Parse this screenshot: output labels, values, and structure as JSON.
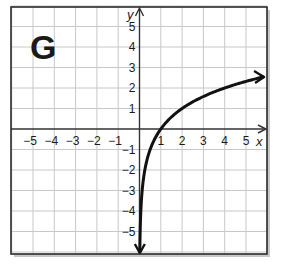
{
  "chart_data": {
    "type": "line",
    "title": "",
    "panel_label": "G",
    "xlabel": "x",
    "ylabel": "y",
    "xlim": [
      -6,
      6
    ],
    "ylim": [
      -6,
      6
    ],
    "grid": true,
    "x_ticks": [
      -5,
      -4,
      -3,
      -2,
      -1,
      1,
      2,
      3,
      4,
      5
    ],
    "y_ticks": [
      5,
      4,
      3,
      2,
      1,
      -1,
      -2,
      -3,
      -4,
      -5
    ],
    "x_tick_labels": [
      "−5",
      "−4",
      "−3",
      "−2",
      "−1",
      "1",
      "2",
      "3",
      "4",
      "5"
    ],
    "y_tick_labels": [
      "5",
      "4",
      "3",
      "2",
      "1",
      "−1",
      "−2",
      "−3",
      "−4",
      "−5"
    ],
    "series": [
      {
        "name": "y = log2(x)",
        "function": "log2(x)",
        "x": [
          0.0156,
          0.03125,
          0.0625,
          0.125,
          0.25,
          0.5,
          1,
          2,
          3,
          4,
          5,
          5.8
        ],
        "y": [
          -6,
          -5,
          -4,
          -3,
          -2,
          -1,
          0,
          1,
          1.58,
          2,
          2.32,
          2.54
        ],
        "arrows": "both_ends"
      }
    ]
  },
  "colors": {
    "grid": "#c8c8c8",
    "axis": "#333333",
    "frame": "#2a2a2a",
    "curve": "#111111",
    "shadow": "#9a9a9a"
  }
}
